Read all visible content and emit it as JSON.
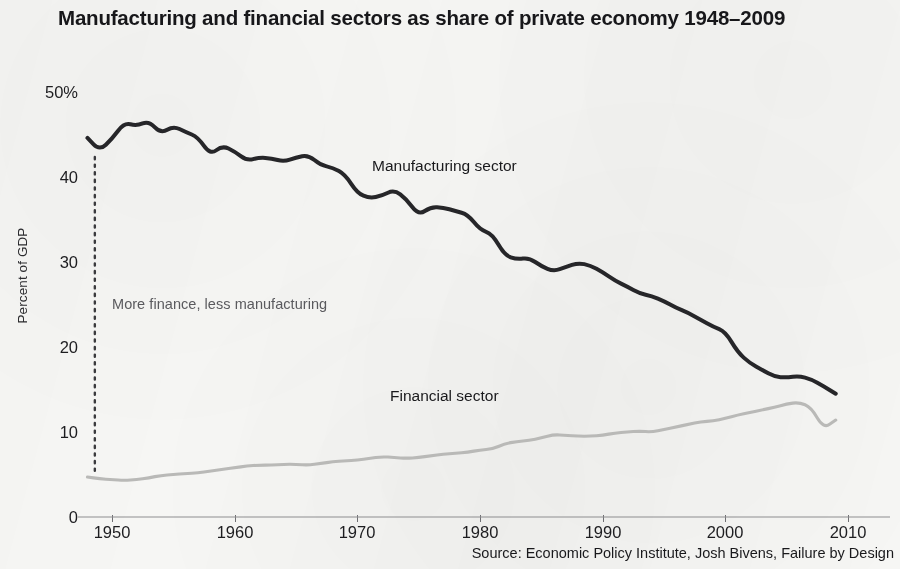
{
  "chart_data": {
    "type": "line",
    "title": "Manufacturing and financial sectors as share of private economy 1948–2009",
    "xlabel": "",
    "ylabel": "Percent of GDP",
    "xlim": [
      1947,
      2011
    ],
    "ylim": [
      0,
      50
    ],
    "grid": false,
    "legend_position": "inline-annotations",
    "x_tick_labels": [
      "1950",
      "1960",
      "1970",
      "1980",
      "1990",
      "2000",
      "2010"
    ],
    "x_ticks": [
      1950,
      1960,
      1970,
      1980,
      1990,
      2000,
      2010
    ],
    "y_tick_labels": [
      "50%",
      "40",
      "30",
      "20",
      "10",
      "0"
    ],
    "y_ticks": [
      50,
      40,
      30,
      20,
      10,
      0
    ],
    "x": [
      1948,
      1949,
      1950,
      1951,
      1952,
      1953,
      1954,
      1955,
      1956,
      1957,
      1958,
      1959,
      1960,
      1961,
      1962,
      1963,
      1964,
      1965,
      1966,
      1967,
      1968,
      1969,
      1970,
      1971,
      1972,
      1973,
      1974,
      1975,
      1976,
      1977,
      1978,
      1979,
      1980,
      1981,
      1982,
      1983,
      1984,
      1985,
      1986,
      1987,
      1988,
      1989,
      1990,
      1991,
      1992,
      1993,
      1994,
      1995,
      1996,
      1997,
      1998,
      1999,
      2000,
      2001,
      2002,
      2003,
      2004,
      2005,
      2006,
      2007,
      2008,
      2009
    ],
    "series": [
      {
        "name": "Manufacturing sector",
        "color": "#262629",
        "values": [
          44.6,
          43.1,
          44.5,
          46.4,
          46.0,
          46.6,
          45.1,
          46.0,
          45.3,
          44.7,
          42.6,
          43.7,
          43.0,
          41.9,
          42.3,
          42.2,
          41.8,
          42.3,
          42.6,
          41.4,
          41.1,
          40.3,
          38.1,
          37.5,
          37.8,
          38.5,
          37.4,
          35.5,
          36.5,
          36.4,
          36.0,
          35.6,
          33.8,
          33.3,
          30.8,
          30.3,
          30.5,
          29.5,
          28.9,
          29.4,
          29.9,
          29.6,
          28.8,
          27.8,
          27.1,
          26.3,
          26.0,
          25.4,
          24.6,
          24.0,
          23.2,
          22.4,
          21.8,
          19.4,
          18.1,
          17.3,
          16.5,
          16.4,
          16.6,
          16.2,
          15.4,
          14.5
        ]
      },
      {
        "name": "Financial sector",
        "color": "#b9b9b7",
        "values": [
          4.7,
          4.5,
          4.4,
          4.3,
          4.4,
          4.6,
          4.9,
          5.0,
          5.1,
          5.2,
          5.4,
          5.6,
          5.8,
          6.0,
          6.1,
          6.1,
          6.2,
          6.2,
          6.1,
          6.3,
          6.5,
          6.6,
          6.7,
          6.9,
          7.1,
          7.0,
          6.9,
          7.0,
          7.2,
          7.4,
          7.5,
          7.6,
          7.9,
          8.0,
          8.6,
          8.9,
          9.0,
          9.3,
          9.7,
          9.6,
          9.5,
          9.5,
          9.6,
          9.9,
          10.0,
          10.1,
          10.0,
          10.3,
          10.6,
          10.9,
          11.2,
          11.3,
          11.6,
          12.0,
          12.3,
          12.6,
          12.9,
          13.3,
          13.5,
          12.9,
          10.4,
          11.4
        ]
      }
    ],
    "annotations": [
      {
        "id": "threshold-note",
        "text": "More finance, less manufacturing",
        "x": 1948.6,
        "type": "vertical-dotted-line-label"
      }
    ],
    "source": "Source: Economic Policy Institute, Josh Bivens, Failure by Design"
  },
  "labels": {
    "series_manufacturing": "Manufacturing sector",
    "series_financial": "Financial sector"
  }
}
